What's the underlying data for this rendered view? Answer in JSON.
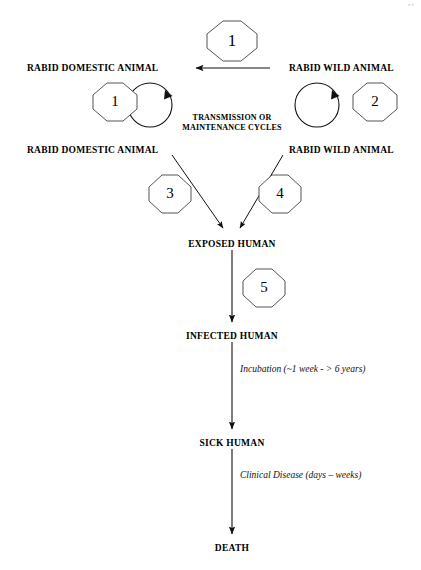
{
  "diagram": {
    "corner_mark": "▪▪",
    "stroke_color": "#111111",
    "text_color": "#000000",
    "background": "#ffffff",
    "nodes": [
      {
        "id": "rabid-domestic-animal-top",
        "label": "RABID DOMESTIC ANIMAL",
        "x": 27,
        "y": 63
      },
      {
        "id": "rabid-wild-animal-top",
        "label": "RABID WILD ANIMAL",
        "x": 289,
        "y": 63
      },
      {
        "id": "rabid-domestic-animal-lower",
        "label": "RABID DOMESTIC ANIMAL",
        "x": 27,
        "y": 145
      },
      {
        "id": "rabid-wild-animal-lower",
        "label": "RABID WILD ANIMAL",
        "x": 289,
        "y": 145
      },
      {
        "id": "exposed-human",
        "label": "EXPOSED HUMAN",
        "x": 232,
        "y": 239
      },
      {
        "id": "infected-human",
        "label": "INFECTED HUMAN",
        "x": 232,
        "y": 331
      },
      {
        "id": "sick-human",
        "label": "SICK HUMAN",
        "x": 232,
        "y": 438
      },
      {
        "id": "death",
        "label": "DEATH",
        "x": 232,
        "y": 543
      }
    ],
    "cycle_caption": {
      "line1": "TRANSMISSION OR",
      "line2": "MAINTENANCE CYCLES",
      "x": 232,
      "y": 113
    },
    "step_badges": [
      {
        "id": "step-1-spillover",
        "number": "1",
        "x": 206,
        "y": 20,
        "size": 40
      },
      {
        "id": "step-1-domestic-cycle",
        "number": "1",
        "x": 92,
        "y": 82,
        "size": 38
      },
      {
        "id": "step-2-wild-cycle",
        "number": "2",
        "x": 352,
        "y": 82,
        "size": 38
      },
      {
        "id": "step-3-domestic-to-human",
        "number": "3",
        "x": 148,
        "y": 174,
        "size": 38
      },
      {
        "id": "step-4-wild-to-human",
        "number": "4",
        "x": 258,
        "y": 174,
        "size": 38
      },
      {
        "id": "step-5-exposure-to-infection",
        "number": "5",
        "x": 242,
        "y": 268,
        "size": 38
      }
    ],
    "phase_notes": [
      {
        "id": "incubation-note",
        "text": "Incubation (~1 week - > 6 years)",
        "x": 240,
        "y": 364
      },
      {
        "id": "clinical-disease-note",
        "text": "Clinical Disease (days – weeks)",
        "x": 240,
        "y": 470
      }
    ],
    "cycles": [
      {
        "id": "domestic-maintenance-cycle",
        "cx": 150,
        "cy": 105,
        "r": 22
      },
      {
        "id": "wild-maintenance-cycle",
        "cx": 317,
        "cy": 105,
        "r": 22
      }
    ]
  }
}
